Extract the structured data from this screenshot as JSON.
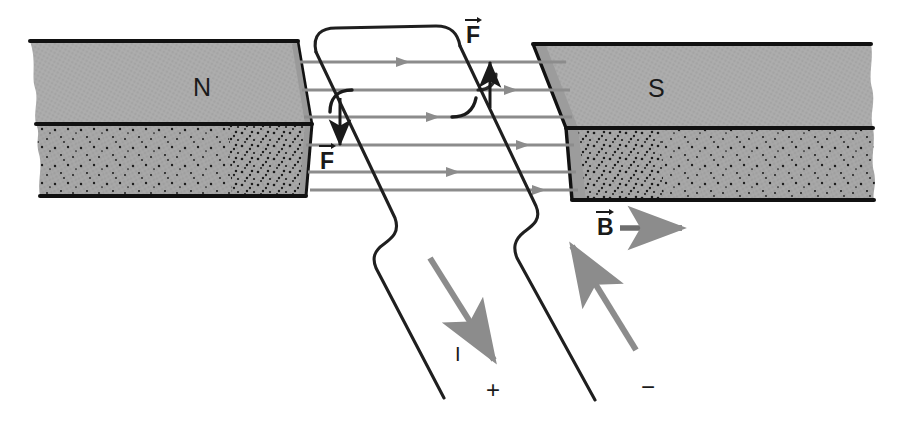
{
  "figure": {
    "domain_kind": "physics-diagram",
    "background_color": "#ffffff",
    "ink_color": "#1a1a1a",
    "magnet_fill": "#a8a8a8",
    "magnet_edge": "#111111",
    "fieldline_color": "#8c8c8c",
    "wire_color": "#1f1f1f",
    "current_arrow_color": "#8c8c8c"
  },
  "magnets": {
    "left": {
      "pole_label": "N",
      "label_x": 193,
      "label_y": 75,
      "description": "left pole piece with top face and stippled front face, broken left edge"
    },
    "right": {
      "pole_label": "S",
      "label_x": 648,
      "label_y": 76,
      "description": "right pole piece with top face and stippled front face, broken right edge"
    }
  },
  "field": {
    "b_label": "B",
    "b_label_x": 600,
    "b_label_y": 218,
    "b_arrow_length": 62,
    "line_count": 6,
    "direction": "left-to-right",
    "lines_y": [
      62,
      90,
      117,
      145,
      172,
      190
    ],
    "lines_x_start": 300,
    "lines_x_end": 566
  },
  "forces": [
    {
      "label": "F",
      "direction": "up",
      "label_x": 469,
      "label_y": 26,
      "arrow_x": 490,
      "arrow_top": 64,
      "arrow_bottom": 108,
      "note": "force on right-hand wire segment"
    },
    {
      "label": "F",
      "direction": "down",
      "label_x": 322,
      "label_y": 152,
      "arrow_x": 340,
      "arrow_top": 98,
      "arrow_bottom": 143,
      "note": "force on left-hand wire segment"
    }
  ],
  "circuit": {
    "current_label": "I",
    "current_label_x": 457,
    "current_label_y": 352,
    "positive_terminal": "+",
    "positive_x": 490,
    "positive_y": 388,
    "negative_terminal": "−",
    "negative_x": 645,
    "negative_y": 385,
    "current_in_direction": "down-right along left lead",
    "current_out_direction": "up-left along right lead"
  }
}
